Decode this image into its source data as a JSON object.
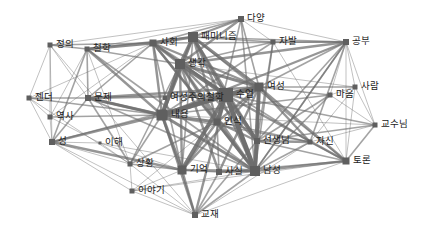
{
  "diagram": {
    "type": "network",
    "edge_color": "#6e6e6e",
    "node_color": "#5f5f5f",
    "nodes": [
      {
        "id": "다양",
        "x": 241,
        "y": 19,
        "s": 6
      },
      {
        "id": "공부",
        "x": 346,
        "y": 42,
        "s": 6
      },
      {
        "id": "패미니즘",
        "x": 193,
        "y": 37,
        "s": 10
      },
      {
        "id": "사회",
        "x": 153,
        "y": 43,
        "s": 7
      },
      {
        "id": "철학",
        "x": 87,
        "y": 49,
        "s": 5
      },
      {
        "id": "정의",
        "x": 50,
        "y": 45,
        "s": 5
      },
      {
        "id": "자발",
        "x": 273,
        "y": 42,
        "s": 5
      },
      {
        "id": "생각",
        "x": 180,
        "y": 64,
        "s": 10
      },
      {
        "id": "사람",
        "x": 355,
        "y": 87,
        "s": 5
      },
      {
        "id": "여성",
        "x": 259,
        "y": 87,
        "s": 9
      },
      {
        "id": "수업",
        "x": 226,
        "y": 95,
        "s": 14
      },
      {
        "id": "마음",
        "x": 330,
        "y": 95,
        "s": 5
      },
      {
        "id": "여성주의철학",
        "x": 165,
        "y": 98,
        "s": 4
      },
      {
        "id": "문제",
        "x": 88,
        "y": 98,
        "s": 6
      },
      {
        "id": "젠더",
        "x": 29,
        "y": 98,
        "s": 5
      },
      {
        "id": "내용",
        "x": 162,
        "y": 115,
        "s": 11
      },
      {
        "id": "인식",
        "x": 217,
        "y": 122,
        "s": 7
      },
      {
        "id": "역사",
        "x": 50,
        "y": 117,
        "s": 5
      },
      {
        "id": "교수님",
        "x": 375,
        "y": 125,
        "s": 5
      },
      {
        "id": "선생님",
        "x": 257,
        "y": 141,
        "s": 6
      },
      {
        "id": "자신",
        "x": 310,
        "y": 142,
        "s": 5
      },
      {
        "id": "성",
        "x": 52,
        "y": 142,
        "s": 6
      },
      {
        "id": "이해",
        "x": 100,
        "y": 143,
        "s": 3
      },
      {
        "id": "토론",
        "x": 346,
        "y": 161,
        "s": 7
      },
      {
        "id": "기억",
        "x": 182,
        "y": 170,
        "s": 9
      },
      {
        "id": "사실",
        "x": 219,
        "y": 172,
        "s": 6
      },
      {
        "id": "남성",
        "x": 255,
        "y": 171,
        "s": 10
      },
      {
        "id": "상황",
        "x": 130,
        "y": 164,
        "s": 5
      },
      {
        "id": "이야기",
        "x": 132,
        "y": 191,
        "s": 5
      },
      {
        "id": "교재",
        "x": 195,
        "y": 215,
        "s": 6
      }
    ],
    "edges": [
      [
        "수업",
        "여성",
        6
      ],
      [
        "수업",
        "내용",
        6
      ],
      [
        "수업",
        "생각",
        5
      ],
      [
        "수업",
        "남성",
        6
      ],
      [
        "수업",
        "인식",
        5
      ],
      [
        "수업",
        "선생님",
        5
      ],
      [
        "수업",
        "패미니즘",
        4
      ],
      [
        "수업",
        "기억",
        5
      ],
      [
        "수업",
        "사회",
        3
      ],
      [
        "수업",
        "문제",
        3
      ],
      [
        "수업",
        "토론",
        3
      ],
      [
        "수업",
        "교재",
        3
      ],
      [
        "여성",
        "남성",
        5
      ],
      [
        "여성",
        "내용",
        4
      ],
      [
        "여성",
        "생각",
        4
      ],
      [
        "여성",
        "패미니즘",
        4
      ],
      [
        "여성",
        "사회",
        3
      ],
      [
        "여성",
        "선생님",
        3
      ],
      [
        "여성",
        "토론",
        3
      ],
      [
        "여성",
        "자신",
        3
      ],
      [
        "여성",
        "마음",
        2
      ],
      [
        "여성",
        "공부",
        2
      ],
      [
        "여성",
        "다양",
        2
      ],
      [
        "여성",
        "기억",
        3
      ],
      [
        "내용",
        "생각",
        5
      ],
      [
        "내용",
        "인식",
        4
      ],
      [
        "내용",
        "남성",
        4
      ],
      [
        "내용",
        "기억",
        4
      ],
      [
        "내용",
        "문제",
        3
      ],
      [
        "내용",
        "성",
        3
      ],
      [
        "내용",
        "패미니즘",
        4
      ],
      [
        "내용",
        "사회",
        3
      ],
      [
        "내용",
        "교재",
        3
      ],
      [
        "내용",
        "상황",
        2
      ],
      [
        "내용",
        "공부",
        3
      ],
      [
        "내용",
        "자신",
        2
      ],
      [
        "생각",
        "패미니즘",
        4
      ],
      [
        "생각",
        "사회",
        3
      ],
      [
        "생각",
        "다양",
        3
      ],
      [
        "생각",
        "남성",
        3
      ],
      [
        "생각",
        "인식",
        3
      ],
      [
        "생각",
        "기억",
        3
      ],
      [
        "생각",
        "철학",
        2
      ],
      [
        "생각",
        "자발",
        2
      ],
      [
        "생각",
        "공부",
        3
      ],
      [
        "생각",
        "선생님",
        3
      ],
      [
        "패미니즘",
        "사회",
        4
      ],
      [
        "패미니즘",
        "다양",
        3
      ],
      [
        "패미니즘",
        "자발",
        2
      ],
      [
        "패미니즘",
        "공부",
        2
      ],
      [
        "패미니즘",
        "철학",
        2
      ],
      [
        "패미니즘",
        "남성",
        3
      ],
      [
        "패미니즘",
        "선생님",
        3
      ],
      [
        "패미니즘",
        "토론",
        2
      ],
      [
        "패미니즘",
        "인식",
        3
      ],
      [
        "사회",
        "철학",
        4
      ],
      [
        "사회",
        "정의",
        2
      ],
      [
        "사회",
        "인식",
        3
      ],
      [
        "사회",
        "남성",
        3
      ],
      [
        "사회",
        "기억",
        2
      ],
      [
        "사회",
        "다양",
        2
      ],
      [
        "사회",
        "자신",
        2
      ],
      [
        "철학",
        "정의",
        2
      ],
      [
        "철학",
        "문제",
        2
      ],
      [
        "철학",
        "내용",
        3
      ],
      [
        "철학",
        "성",
        2
      ],
      [
        "철학",
        "역사",
        1
      ],
      [
        "철학",
        "남성",
        2
      ],
      [
        "철학",
        "상황",
        1
      ],
      [
        "정의",
        "젠더",
        1
      ],
      [
        "정의",
        "역사",
        1
      ],
      [
        "정의",
        "성",
        1
      ],
      [
        "정의",
        "다양",
        1
      ],
      [
        "정의",
        "문제",
        1
      ],
      [
        "정의",
        "교재",
        1
      ],
      [
        "젠더",
        "문제",
        2
      ],
      [
        "젠더",
        "역사",
        1
      ],
      [
        "젠더",
        "성",
        1
      ],
      [
        "젠더",
        "내용",
        2
      ],
      [
        "젠더",
        "사회",
        1
      ],
      [
        "젠더",
        "상황",
        1
      ],
      [
        "문제",
        "내용",
        4
      ],
      [
        "문제",
        "성",
        2
      ],
      [
        "문제",
        "여성",
        3
      ],
      [
        "문제",
        "상황",
        2
      ],
      [
        "문제",
        "사회",
        2
      ],
      [
        "문제",
        "남성",
        2
      ],
      [
        "역사",
        "성",
        1
      ],
      [
        "역사",
        "내용",
        2
      ],
      [
        "역사",
        "이해",
        1
      ],
      [
        "역사",
        "사회",
        1
      ],
      [
        "성",
        "기억",
        3
      ],
      [
        "성",
        "이야기",
        1
      ],
      [
        "성",
        "상황",
        1
      ],
      [
        "성",
        "이해",
        1
      ],
      [
        "성",
        "교재",
        1
      ],
      [
        "성",
        "여성",
        2
      ],
      [
        "이해",
        "상황",
        1
      ],
      [
        "이해",
        "기억",
        1
      ],
      [
        "이해",
        "남성",
        1
      ],
      [
        "상황",
        "이야기",
        1
      ],
      [
        "상황",
        "기억",
        2
      ],
      [
        "상황",
        "교재",
        1
      ],
      [
        "상황",
        "인식",
        2
      ],
      [
        "상황",
        "생각",
        2
      ],
      [
        "이야기",
        "교재",
        1
      ],
      [
        "이야기",
        "기억",
        1
      ],
      [
        "이야기",
        "남성",
        1
      ],
      [
        "이야기",
        "인식",
        1
      ],
      [
        "이야기",
        "토론",
        1
      ],
      [
        "교재",
        "기억",
        3
      ],
      [
        "교재",
        "사실",
        2
      ],
      [
        "교재",
        "남성",
        2
      ],
      [
        "교재",
        "토론",
        1
      ],
      [
        "교재",
        "자신",
        1
      ],
      [
        "교재",
        "선생님",
        2
      ],
      [
        "기억",
        "사실",
        2
      ],
      [
        "기억",
        "남성",
        3
      ],
      [
        "기억",
        "인식",
        3
      ],
      [
        "기억",
        "패미니즘",
        2
      ],
      [
        "사실",
        "남성",
        3
      ],
      [
        "사실",
        "인식",
        2
      ],
      [
        "사실",
        "생각",
        3
      ],
      [
        "사실",
        "토론",
        2
      ],
      [
        "사실",
        "여성",
        3
      ],
      [
        "남성",
        "선생님",
        4
      ],
      [
        "남성",
        "인식",
        4
      ],
      [
        "남성",
        "토론",
        3
      ],
      [
        "남성",
        "자신",
        2
      ],
      [
        "남성",
        "마음",
        2
      ],
      [
        "남성",
        "공부",
        2
      ],
      [
        "인식",
        "선생님",
        3
      ],
      [
        "인식",
        "자신",
        2
      ],
      [
        "인식",
        "여성",
        3
      ],
      [
        "선생님",
        "자신",
        3
      ],
      [
        "선생님",
        "토론",
        2
      ],
      [
        "선생님",
        "교수님",
        2
      ],
      [
        "선생님",
        "공부",
        2
      ],
      [
        "자신",
        "토론",
        2
      ],
      [
        "자신",
        "교수님",
        1
      ],
      [
        "자신",
        "공부",
        2
      ],
      [
        "자신",
        "사람",
        1
      ],
      [
        "토론",
        "교수님",
        2
      ],
      [
        "토론",
        "사람",
        1
      ],
      [
        "토론",
        "공부",
        1
      ],
      [
        "토론",
        "자발",
        1
      ],
      [
        "교수님",
        "사람",
        1
      ],
      [
        "교수님",
        "공부",
        1
      ],
      [
        "교수님",
        "마음",
        1
      ],
      [
        "교수님",
        "내용",
        1
      ],
      [
        "교수님",
        "수업",
        2
      ],
      [
        "사람",
        "공부",
        1
      ],
      [
        "사람",
        "마음",
        1
      ],
      [
        "사람",
        "여성",
        2
      ],
      [
        "사람",
        "생각",
        1
      ],
      [
        "마음",
        "공부",
        1
      ],
      [
        "마음",
        "선생님",
        2
      ],
      [
        "마음",
        "내용",
        2
      ],
      [
        "공부",
        "다양",
        1
      ],
      [
        "공부",
        "자발",
        2
      ],
      [
        "공부",
        "사회",
        2
      ],
      [
        "공부",
        "남성",
        2
      ],
      [
        "자발",
        "다양",
        1
      ],
      [
        "자발",
        "남성",
        2
      ],
      [
        "자발",
        "선생님",
        2
      ],
      [
        "자발",
        "내용",
        2
      ],
      [
        "다양",
        "남성",
        2
      ],
      [
        "다양",
        "인식",
        2
      ],
      [
        "다양",
        "철학",
        1
      ]
    ]
  }
}
